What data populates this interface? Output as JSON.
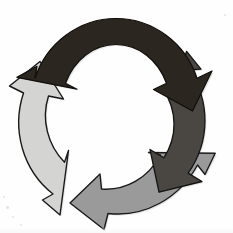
{
  "figure": {
    "background_color": "#fefefe",
    "width": 233,
    "height": 233,
    "center_x": 116,
    "center_y": 116,
    "outer_radius": 100,
    "inner_radius": 64,
    "rotation_direction": "clockwise",
    "outline_color": "#1a1a1a",
    "outline_width": "1.4"
  },
  "arrows": [
    {
      "id": "arrow-top",
      "position": "top",
      "label": "",
      "fill_color": "#2b2620",
      "tone": "near-black",
      "start_angle_deg": -160,
      "end_angle_deg": -28,
      "head_direction": "down-right",
      "clock_span": "10 o'clock to 2 o'clock"
    },
    {
      "id": "arrow-right",
      "position": "right",
      "label": "",
      "fill_color": "#4a4642",
      "tone": "dark-gray",
      "start_angle_deg": -70,
      "end_angle_deg": 62,
      "head_direction": "down-left",
      "clock_span": "1 o'clock to 5 o'clock"
    },
    {
      "id": "arrow-bottom",
      "position": "bottom",
      "label": "",
      "fill_color": "#9a9a9a",
      "tone": "medium-gray",
      "start_angle_deg": 20,
      "end_angle_deg": 152,
      "head_direction": "up-left",
      "clock_span": "4 o'clock to 8 o'clock"
    },
    {
      "id": "arrow-left",
      "position": "left",
      "label": "",
      "fill_color": "#d4d4d2",
      "tone": "light-gray",
      "start_angle_deg": 110,
      "end_angle_deg": 242,
      "head_direction": "up-right",
      "clock_span": "7 o'clock to 11 o'clock"
    }
  ],
  "geometry": {
    "arrow_top_path": "M 16.9 77.4 L 37.0 66.3 L 35.0 78.2 C 46.3 43.1 79.0 18.5 116.0 18.5 C 153.0 18.5 185.7 43.1 197.0 78.2 L 212.0 71.0 L 192.5 111.0 L 153.5 89.5 L 166.5 83.3 C 158.0 60.2 138.6 44.5 116.0 44.5 C 93.4 44.5 74.0 60.2 65.5 83.3 L 77.0 89.2 Z",
    "arrow_right_path": "M 186.6 51.3 L 201.0 69.2 L 189.0 70.0 C 210.3 100.2 210.6 141.2 188.1 173.1 L 202.0 181.5 L 159.0 192.2 L 150.0 149.5 L 163.8 157.8 C 177.6 136.9 177.4 110.5 163.3 89.8 L 172.5 97.0 Z",
    "arrow_bottom_path": "M 215.2 153.3 L 205.0 174.5 L 197.5 165.0 C 179.0 199.0 144.0 217.5 108.0 213.5 L 104.0 229.5 L 70.0 203.0 L 100.0 174.0 L 101.5 189.0 C 125.5 190.8 148.0 178.3 160.5 155.0 L 148.5 152.5 Z",
    "arrow_left_path": "M 60.0 215.0 L 42.5 200.0 L 53.0 194.0 C 22.5 170.0 11.5 129.5 23.5 93.0 L 9.5 86.0 L 40.0 61.5 L 63.5 99.0 L 48.5 96.0 C 41.0 119.5 47.5 144.8 64.5 162.3 L 68.5 150.5 Z"
  },
  "scan_artifacts": [
    {
      "left": 6,
      "top": 206,
      "size": 3
    },
    {
      "left": 12,
      "top": 216,
      "size": 2
    },
    {
      "left": 20,
      "top": 224,
      "size": 2
    },
    {
      "left": 3,
      "top": 196,
      "size": 2
    },
    {
      "left": 224,
      "top": 14,
      "size": 2
    }
  ]
}
